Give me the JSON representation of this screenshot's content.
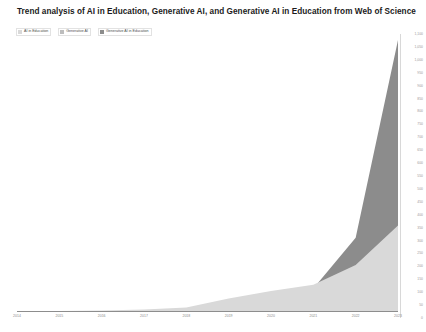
{
  "header": {
    "title": "Trend analysis of AI in Education, Generative AI, and Generative AI in Education from Web of Science"
  },
  "legend": {
    "position": "top-left",
    "items": [
      {
        "label": "AI in Education",
        "color": "#d9d9d9"
      },
      {
        "label": "Generative AI",
        "color": "#bdbdbd"
      },
      {
        "label": "Generative AI in Education",
        "color": "#8c8c8c"
      }
    ]
  },
  "axes": {
    "y_position": "right",
    "y_ticks": [
      "1,100",
      "1,050",
      "1,000",
      "950",
      "900",
      "850",
      "800",
      "750",
      "700",
      "650",
      "600",
      "550",
      "500",
      "450",
      "400",
      "350",
      "300",
      "250",
      "200",
      "150",
      "100",
      "50",
      "0"
    ],
    "x_ticks": [
      "2014",
      "2015",
      "2016",
      "2017",
      "2018",
      "2019",
      "2020",
      "2021",
      "2022",
      "2023"
    ]
  },
  "chart_data": {
    "type": "area",
    "title": "Trend analysis of AI in Education, Generative AI, and Generative AI in Education from Web of Science",
    "xlabel": "",
    "ylabel": "",
    "categories": [
      "2014",
      "2015",
      "2016",
      "2017",
      "2018",
      "2019",
      "2020",
      "2021",
      "2022",
      "2023"
    ],
    "ylim": [
      0,
      1100
    ],
    "yticks": [
      0,
      50,
      100,
      150,
      200,
      250,
      300,
      350,
      400,
      450,
      500,
      550,
      600,
      650,
      700,
      750,
      800,
      850,
      900,
      950,
      1000,
      1050,
      1100
    ],
    "grid": false,
    "legend_position": "top-left",
    "stacked": false,
    "series": [
      {
        "name": "AI in Education",
        "color": "#d9d9d9",
        "values": [
          2,
          4,
          6,
          10,
          18,
          55,
          85,
          110,
          190,
          350
        ]
      },
      {
        "name": "Generative AI",
        "color": "#bdbdbd",
        "values": [
          1,
          2,
          3,
          5,
          12,
          40,
          70,
          100,
          175,
          330
        ]
      },
      {
        "name": "Generative AI in Education",
        "color": "#8c8c8c",
        "values": [
          0,
          1,
          1,
          2,
          5,
          20,
          45,
          95,
          300,
          1100
        ]
      }
    ]
  },
  "colors": {
    "background": "#ffffff",
    "title_color": "#1b1b1b",
    "axis_text": "#8c8c8c",
    "axis_line": "#8d8d8d",
    "series_light": "#d9d9d9",
    "series_mid": "#bdbdbd",
    "series_dark": "#8c8c8c"
  }
}
